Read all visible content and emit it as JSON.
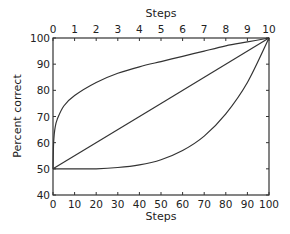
{
  "chart_data": {
    "type": "line",
    "title": "",
    "xlabel": "Steps",
    "x2label": "Steps",
    "ylabel": "Percent correct",
    "xlim": [
      0,
      100
    ],
    "x2lim": [
      0,
      10
    ],
    "ylim": [
      40,
      100
    ],
    "xticks": [
      0,
      10,
      20,
      30,
      40,
      50,
      60,
      70,
      80,
      90,
      100
    ],
    "x2ticks": [
      0,
      1,
      2,
      3,
      4,
      5,
      6,
      7,
      8,
      9,
      10
    ],
    "yticks": [
      40,
      50,
      60,
      70,
      80,
      90,
      100
    ],
    "grid": false,
    "legend": null,
    "series": [
      {
        "name": "concave",
        "x": [
          0,
          0.3,
          1,
          2,
          5,
          10,
          20,
          30,
          40,
          50,
          60,
          70,
          80,
          90,
          100
        ],
        "values": [
          50,
          60,
          66,
          69,
          74,
          78,
          83,
          86.5,
          89,
          91,
          93,
          95,
          97,
          98.5,
          100
        ]
      },
      {
        "name": "linear",
        "x": [
          0,
          100
        ],
        "values": [
          50,
          100
        ]
      },
      {
        "name": "convex",
        "x": [
          0,
          10,
          20,
          30,
          40,
          50,
          60,
          70,
          80,
          90,
          100
        ],
        "values": [
          50,
          50,
          50,
          50.5,
          51.5,
          53.5,
          57,
          62.5,
          71,
          83,
          100
        ]
      }
    ]
  }
}
